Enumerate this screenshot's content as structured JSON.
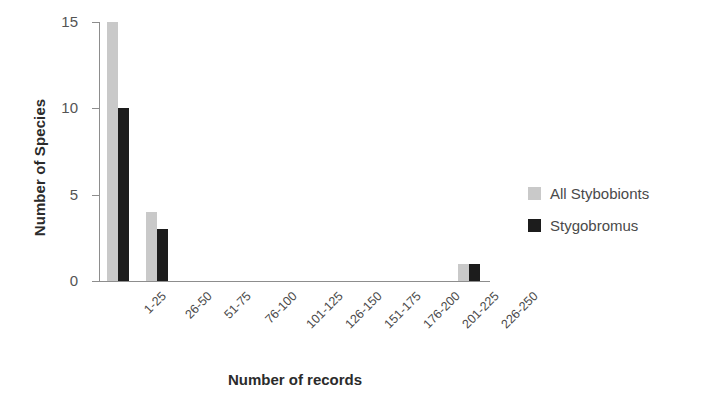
{
  "chart_data": {
    "type": "bar",
    "title": "",
    "xlabel": "Number of records",
    "ylabel": "Number of Species",
    "categories": [
      "1-25",
      "26-50",
      "51-75",
      "76-100",
      "101-125",
      "126-150",
      "151-175",
      "176-200",
      "201-225",
      "226-250"
    ],
    "series": [
      {
        "name": "All Stybobionts",
        "color": "#c9c9c9",
        "values": [
          15,
          4,
          0,
          0,
          0,
          0,
          0,
          0,
          0,
          1
        ]
      },
      {
        "name": "Stygobromus",
        "color": "#1c1c1c",
        "values": [
          10,
          3,
          0,
          0,
          0,
          0,
          0,
          0,
          0,
          1
        ]
      }
    ],
    "ylim": [
      0,
      15
    ],
    "yticks": [
      0,
      5,
      10,
      15
    ],
    "ytick_labels": [
      "0",
      "5",
      "10",
      "15"
    ],
    "grid": false,
    "legend_position": "right",
    "xtick_rotation": -45
  },
  "axes": {
    "y_title": "Number of Species",
    "x_title": "Number of records"
  },
  "legend": {
    "entries": [
      {
        "label": "All Stybobionts",
        "swatch": "legend-swatch-gray"
      },
      {
        "label": "Stygobromus",
        "swatch": "legend-swatch-black"
      }
    ]
  }
}
